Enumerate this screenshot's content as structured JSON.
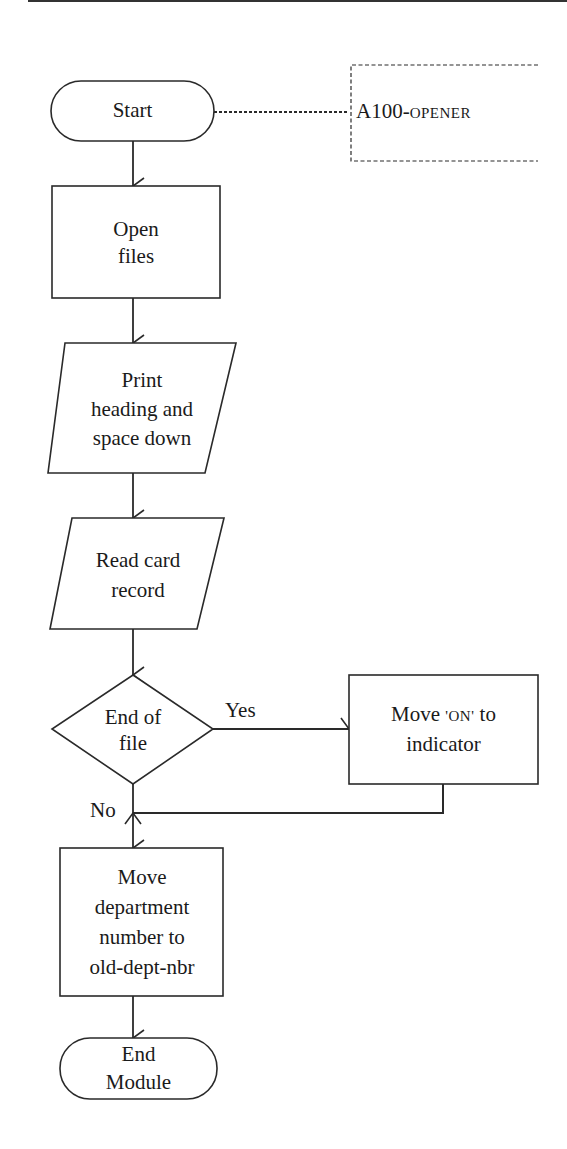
{
  "diagram": {
    "type": "flowchart",
    "module_annotation": {
      "prefix": "A100-",
      "name": "OPENER",
      "full_text": "A100-OPENER"
    },
    "nodes": [
      {
        "id": "start",
        "shape": "terminal",
        "lines": [
          "Start"
        ]
      },
      {
        "id": "open_files",
        "shape": "process",
        "lines": [
          "Open",
          "files"
        ]
      },
      {
        "id": "print_heading",
        "shape": "input-output",
        "lines": [
          "Print",
          "heading and",
          "space down"
        ]
      },
      {
        "id": "read_card",
        "shape": "input-output",
        "lines": [
          "Read card",
          "record"
        ]
      },
      {
        "id": "end_of_file",
        "shape": "decision",
        "lines": [
          "End of",
          "file"
        ]
      },
      {
        "id": "move_on",
        "shape": "process",
        "lines": [
          "Move 'ON' to",
          "indicator"
        ],
        "parts": {
          "before": "Move ",
          "literal": "'ON'",
          "after": " to"
        }
      },
      {
        "id": "move_dept",
        "shape": "process",
        "lines": [
          "Move",
          "department",
          "number to",
          "old-dept-nbr"
        ]
      },
      {
        "id": "end_module",
        "shape": "terminal",
        "lines": [
          "End",
          "Module"
        ]
      }
    ],
    "edges": [
      {
        "from": "start",
        "to": "annotation",
        "style": "dashed"
      },
      {
        "from": "start",
        "to": "open_files"
      },
      {
        "from": "open_files",
        "to": "print_heading"
      },
      {
        "from": "print_heading",
        "to": "read_card"
      },
      {
        "from": "read_card",
        "to": "end_of_file"
      },
      {
        "from": "end_of_file",
        "to": "move_on",
        "label": "Yes"
      },
      {
        "from": "end_of_file",
        "to": "move_dept",
        "label": "No"
      },
      {
        "from": "move_on",
        "to": "move_dept"
      },
      {
        "from": "move_dept",
        "to": "end_module"
      }
    ],
    "branch_labels": {
      "yes": "Yes",
      "no": "No"
    },
    "colors": {
      "stroke": "#2a2a2a",
      "background": "#ffffff",
      "text": "#1a1a1a"
    }
  }
}
